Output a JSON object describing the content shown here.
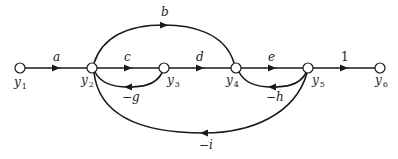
{
  "diagram": {
    "type": "signal-flow-graph",
    "nodes": [
      {
        "id": "y1",
        "label": "y",
        "sub": "1",
        "x": 20,
        "y": 68
      },
      {
        "id": "y2",
        "label": "y",
        "sub": "2",
        "x": 92,
        "y": 68
      },
      {
        "id": "y3",
        "label": "y",
        "sub": "3",
        "x": 164,
        "y": 68
      },
      {
        "id": "y4",
        "label": "y",
        "sub": "4",
        "x": 236,
        "y": 68
      },
      {
        "id": "y5",
        "label": "y",
        "sub": "5",
        "x": 308,
        "y": 68
      },
      {
        "id": "y6",
        "label": "y",
        "sub": "6",
        "x": 380,
        "y": 68
      }
    ],
    "edges": [
      {
        "from": "y1",
        "to": "y2",
        "gain": "a"
      },
      {
        "from": "y2",
        "to": "y3",
        "gain": "c"
      },
      {
        "from": "y3",
        "to": "y4",
        "gain": "d"
      },
      {
        "from": "y4",
        "to": "y5",
        "gain": "e"
      },
      {
        "from": "y5",
        "to": "y6",
        "gain": "1"
      },
      {
        "from": "y2",
        "to": "y4",
        "gain": "b"
      },
      {
        "from": "y3",
        "to": "y2",
        "gain": "−g"
      },
      {
        "from": "y5",
        "to": "y4",
        "gain": "−h"
      },
      {
        "from": "y5",
        "to": "y2",
        "gain": "−i"
      }
    ]
  }
}
